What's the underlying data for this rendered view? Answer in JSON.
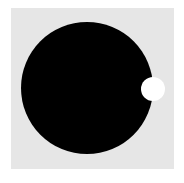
{
  "scene": {
    "background_color": "#ffffff",
    "panel": {
      "color": "#e6e6e6",
      "left": 11,
      "top": 8,
      "width": 163,
      "height": 161
    },
    "shapes": [
      {
        "type": "circle",
        "name": "large-black-circle",
        "color": "#000000",
        "center_x": 87,
        "center_y": 88,
        "radius": 66
      },
      {
        "type": "circle",
        "name": "small-white-circle",
        "color": "#ffffff",
        "center_x": 153,
        "center_y": 89,
        "radius": 12
      }
    ]
  }
}
